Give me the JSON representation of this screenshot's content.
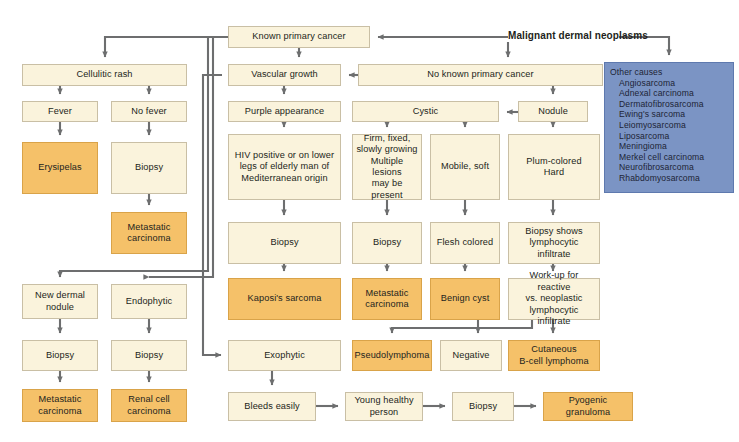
{
  "diagram": {
    "title": "Malignant dermal neoplasms",
    "colors": {
      "cream": "#faf3dc",
      "cream_border": "#c9bfa5",
      "orange": "#f5c169",
      "orange_border": "#d9a349",
      "blue": "#7b94c4",
      "blue_border": "#5e79ae",
      "connector": "#6d6e6f",
      "text": "#231f20",
      "background": "#ffffff"
    },
    "nodes": [
      {
        "id": "known-primary-cancer",
        "label": "Known primary cancer",
        "style": "cream",
        "x": 228,
        "y": 26,
        "w": 142,
        "h": 22
      },
      {
        "id": "cellulitic-rash",
        "label": "Cellulitic rash",
        "style": "cream",
        "x": 22,
        "y": 64,
        "w": 165,
        "h": 22
      },
      {
        "id": "vascular-growth",
        "label": "Vascular growth",
        "style": "cream",
        "x": 228,
        "y": 64,
        "w": 113,
        "h": 22
      },
      {
        "id": "no-known-primary-cancer",
        "label": "No known primary cancer",
        "style": "cream",
        "x": 358,
        "y": 64,
        "w": 245,
        "h": 22
      },
      {
        "id": "other-causes",
        "label": "Other causes",
        "style": "blue",
        "x": 604,
        "y": 62,
        "w": 130,
        "h": 131
      },
      {
        "id": "fever",
        "label": "Fever",
        "style": "cream",
        "x": 22,
        "y": 101,
        "w": 76,
        "h": 21
      },
      {
        "id": "no-fever",
        "label": "No fever",
        "style": "cream",
        "x": 111,
        "y": 101,
        "w": 76,
        "h": 21
      },
      {
        "id": "purple-appearance",
        "label": "Purple appearance",
        "style": "cream",
        "x": 228,
        "y": 101,
        "w": 113,
        "h": 21
      },
      {
        "id": "cystic",
        "label": "Cystic",
        "style": "cream",
        "x": 352,
        "y": 101,
        "w": 147,
        "h": 21
      },
      {
        "id": "nodule",
        "label": "Nodule",
        "style": "cream",
        "x": 518,
        "y": 101,
        "w": 70,
        "h": 21
      },
      {
        "id": "erysipelas",
        "label": "Erysipelas",
        "style": "orange",
        "x": 22,
        "y": 142,
        "w": 76,
        "h": 52
      },
      {
        "id": "biopsy-no-fever",
        "label": "Biopsy",
        "style": "cream",
        "x": 111,
        "y": 142,
        "w": 76,
        "h": 52
      },
      {
        "id": "hiv-positive",
        "label": "HIV positive or on lower\nlegs of elderly man of\nMediterranean origin",
        "style": "cream",
        "x": 228,
        "y": 134,
        "w": 113,
        "h": 66
      },
      {
        "id": "firm-fixed",
        "label": "Firm, fixed,\nslowly growing\nMultiple lesions\nmay be present",
        "style": "cream",
        "x": 352,
        "y": 134,
        "w": 70,
        "h": 66
      },
      {
        "id": "mobile-soft",
        "label": "Mobile, soft",
        "style": "cream",
        "x": 430,
        "y": 134,
        "w": 70,
        "h": 66
      },
      {
        "id": "plum-colored-hard",
        "label": "Plum-colored\nHard",
        "style": "cream",
        "x": 508,
        "y": 134,
        "w": 92,
        "h": 66
      },
      {
        "id": "metastatic-carcinoma-top",
        "label": "Metastatic\ncarcinoma",
        "style": "orange",
        "x": 111,
        "y": 212,
        "w": 76,
        "h": 42
      },
      {
        "id": "biopsy-kaposi",
        "label": "Biopsy",
        "style": "cream",
        "x": 228,
        "y": 222,
        "w": 113,
        "h": 42
      },
      {
        "id": "biopsy-firm",
        "label": "Biopsy",
        "style": "cream",
        "x": 352,
        "y": 222,
        "w": 70,
        "h": 42
      },
      {
        "id": "flesh-colored",
        "label": "Flesh colored",
        "style": "cream",
        "x": 430,
        "y": 222,
        "w": 70,
        "h": 42
      },
      {
        "id": "biopsy-lymphocytic",
        "label": "Biopsy shows\nlymphocytic\ninfiltrate",
        "style": "cream",
        "x": 508,
        "y": 222,
        "w": 92,
        "h": 42
      },
      {
        "id": "new-dermal-nodule",
        "label": "New dermal\nnodule",
        "style": "cream",
        "x": 22,
        "y": 284,
        "w": 76,
        "h": 35
      },
      {
        "id": "endophytic",
        "label": "Endophytic",
        "style": "cream",
        "x": 111,
        "y": 284,
        "w": 76,
        "h": 35
      },
      {
        "id": "kaposis-sarcoma",
        "label": "Kaposi's sarcoma",
        "style": "orange",
        "x": 228,
        "y": 278,
        "w": 113,
        "h": 42
      },
      {
        "id": "metastatic-carcinoma-mid",
        "label": "Metastatic\ncarcinoma",
        "style": "orange",
        "x": 352,
        "y": 278,
        "w": 70,
        "h": 42
      },
      {
        "id": "benign-cyst",
        "label": "Benign cyst",
        "style": "orange",
        "x": 430,
        "y": 278,
        "w": 70,
        "h": 42
      },
      {
        "id": "work-up-reactive",
        "label": "Work-up for reactive\nvs. neoplastic\nlymphocytic infiltrate",
        "style": "cream",
        "x": 508,
        "y": 278,
        "w": 92,
        "h": 42
      },
      {
        "id": "biopsy-new-dermal",
        "label": "Biopsy",
        "style": "cream",
        "x": 22,
        "y": 340,
        "w": 76,
        "h": 31
      },
      {
        "id": "biopsy-endophytic",
        "label": "Biopsy",
        "style": "cream",
        "x": 111,
        "y": 340,
        "w": 76,
        "h": 31
      },
      {
        "id": "exophytic",
        "label": "Exophytic",
        "style": "cream",
        "x": 228,
        "y": 340,
        "w": 113,
        "h": 31
      },
      {
        "id": "pseudolymphoma",
        "label": "Pseudolymphoma",
        "style": "orange",
        "x": 352,
        "y": 340,
        "w": 80,
        "h": 31
      },
      {
        "id": "negative",
        "label": "Negative",
        "style": "cream",
        "x": 440,
        "y": 340,
        "w": 62,
        "h": 31
      },
      {
        "id": "cutaneous-b-cell-lymphoma",
        "label": "Cutaneous\nB-cell lymphoma",
        "style": "orange",
        "x": 508,
        "y": 340,
        "w": 92,
        "h": 31
      },
      {
        "id": "metastatic-carcinoma-bottom",
        "label": "Metastatic\ncarcinoma",
        "style": "orange",
        "x": 22,
        "y": 389,
        "w": 76,
        "h": 33
      },
      {
        "id": "renal-cell-carcinoma",
        "label": "Renal cell\ncarcinoma",
        "style": "orange",
        "x": 111,
        "y": 389,
        "w": 76,
        "h": 33
      },
      {
        "id": "bleeds-easily",
        "label": "Bleeds easily",
        "style": "cream",
        "x": 228,
        "y": 392,
        "w": 88,
        "h": 29
      },
      {
        "id": "young-healthy-person",
        "label": "Young healthy\nperson",
        "style": "cream",
        "x": 345,
        "y": 392,
        "w": 78,
        "h": 29
      },
      {
        "id": "biopsy-pyogenic",
        "label": "Biopsy",
        "style": "cream",
        "x": 452,
        "y": 392,
        "w": 62,
        "h": 29
      },
      {
        "id": "pyogenic-granuloma",
        "label": "Pyogenic\ngranuloma",
        "style": "orange",
        "x": 543,
        "y": 392,
        "w": 90,
        "h": 29
      }
    ],
    "other_causes": {
      "heading": "Other causes",
      "items": [
        "Angiosarcoma",
        "Adnexal carcinoma",
        "Dermatofibrosarcoma",
        "Ewing's sarcoma",
        "Leiomyosarcoma",
        "Liposarcoma",
        "Meningioma",
        "Merkel cell carcinoma",
        "Neurofibrosarcoma",
        "Rhabdomyosarcoma"
      ]
    },
    "edges": [
      {
        "from": "malignant-dermal-neoplasms",
        "to": "known-primary-cancer"
      },
      {
        "from": "malignant-dermal-neoplasms",
        "to": "no-known-primary-cancer"
      },
      {
        "from": "malignant-dermal-neoplasms",
        "to": "other-causes"
      },
      {
        "from": "known-primary-cancer",
        "to": "cellulitic-rash"
      },
      {
        "from": "known-primary-cancer",
        "to": "vascular-growth"
      },
      {
        "from": "known-primary-cancer",
        "to": "new-dermal-nodule"
      },
      {
        "from": "known-primary-cancer",
        "to": "endophytic"
      },
      {
        "from": "no-known-primary-cancer",
        "to": "vascular-growth"
      },
      {
        "from": "no-known-primary-cancer",
        "to": "nodule"
      },
      {
        "from": "nodule",
        "to": "cystic"
      },
      {
        "from": "nodule",
        "to": "plum-colored-hard"
      },
      {
        "from": "cellulitic-rash",
        "to": "fever"
      },
      {
        "from": "cellulitic-rash",
        "to": "no-fever"
      },
      {
        "from": "fever",
        "to": "erysipelas"
      },
      {
        "from": "no-fever",
        "to": "biopsy-no-fever"
      },
      {
        "from": "biopsy-no-fever",
        "to": "metastatic-carcinoma-top"
      },
      {
        "from": "vascular-growth",
        "to": "purple-appearance"
      },
      {
        "from": "purple-appearance",
        "to": "hiv-positive"
      },
      {
        "from": "hiv-positive",
        "to": "biopsy-kaposi"
      },
      {
        "from": "biopsy-kaposi",
        "to": "kaposis-sarcoma"
      },
      {
        "from": "cystic",
        "to": "firm-fixed"
      },
      {
        "from": "cystic",
        "to": "mobile-soft"
      },
      {
        "from": "firm-fixed",
        "to": "biopsy-firm"
      },
      {
        "from": "biopsy-firm",
        "to": "metastatic-carcinoma-mid"
      },
      {
        "from": "mobile-soft",
        "to": "flesh-colored"
      },
      {
        "from": "flesh-colored",
        "to": "benign-cyst"
      },
      {
        "from": "plum-colored-hard",
        "to": "biopsy-lymphocytic"
      },
      {
        "from": "biopsy-lymphocytic",
        "to": "work-up-reactive"
      },
      {
        "from": "work-up-reactive",
        "to": "pseudolymphoma"
      },
      {
        "from": "work-up-reactive",
        "to": "negative"
      },
      {
        "from": "work-up-reactive",
        "to": "cutaneous-b-cell-lymphoma"
      },
      {
        "from": "new-dermal-nodule",
        "to": "biopsy-new-dermal"
      },
      {
        "from": "endophytic",
        "to": "biopsy-endophytic"
      },
      {
        "from": "biopsy-new-dermal",
        "to": "metastatic-carcinoma-bottom"
      },
      {
        "from": "biopsy-endophytic",
        "to": "renal-cell-carcinoma"
      },
      {
        "from": "vascular-growth",
        "to": "exophytic"
      },
      {
        "from": "exophytic",
        "to": "bleeds-easily"
      },
      {
        "from": "bleeds-easily",
        "to": "young-healthy-person"
      },
      {
        "from": "young-healthy-person",
        "to": "biopsy-pyogenic"
      },
      {
        "from": "biopsy-pyogenic",
        "to": "pyogenic-granuloma"
      }
    ]
  }
}
